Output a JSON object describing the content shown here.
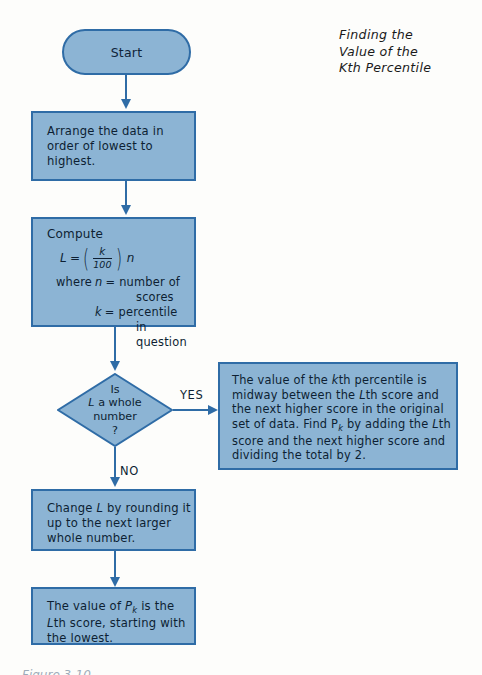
{
  "title": {
    "line1": "Finding the",
    "line2": "Value of the",
    "line3": "Kth Percentile"
  },
  "nodes": {
    "start": {
      "label": "Start",
      "shape": "stadium"
    },
    "arrange": {
      "text": "Arrange the data in order of lowest to highest.",
      "shape": "rectangle"
    },
    "compute": {
      "heading": "Compute",
      "formula": {
        "lhs": "L",
        "equals": "=",
        "numerator": "k",
        "denominator": "100",
        "multiplier": "n"
      },
      "where_label": "where",
      "definitions": [
        {
          "symbol": "n",
          "eq": "=",
          "text": "number of",
          "cont": "scores"
        },
        {
          "symbol": "k",
          "eq": "=",
          "text": "percentile",
          "cont": "in question"
        }
      ],
      "shape": "rectangle"
    },
    "decision": {
      "line1": "Is",
      "line2_italic": "L",
      "line2_rest": " a whole",
      "line3": "number",
      "line4": "?",
      "shape": "diamond"
    },
    "midway": {
      "text_html": "The value of the <i>k</i>th percentile is midway between the <i>L</i>th score and the next higher score in the original set of data. Find P<sub>k</sub> by adding the <i>L</i>th score and the next higher score and dividing the total by 2.",
      "shape": "rectangle"
    },
    "change": {
      "text_html": "Change <i>L</i> by rounding it up to the next larger whole number.",
      "shape": "rectangle"
    },
    "final": {
      "text_html": "The value of <i>P<sub>k</sub></i> is the <i>L</i>th score, starting with the lowest.",
      "shape": "rectangle"
    }
  },
  "branch_labels": {
    "yes": "YES",
    "no": "NO"
  },
  "caption": "Figure 3-10",
  "colors": {
    "node_fill": "#8cb4d4",
    "node_border": "#2f6ca6",
    "connector": "#2f6ca6",
    "text": "#0d1f33",
    "background": "#fdfdfb"
  }
}
